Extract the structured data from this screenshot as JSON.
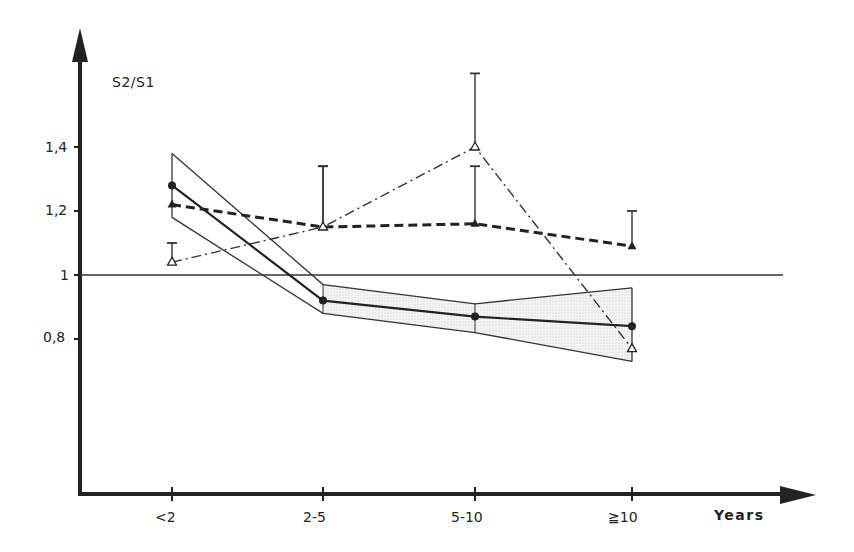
{
  "chart_data": {
    "type": "line",
    "title": "",
    "ylabel": "S2/S1",
    "xlabel": "Years",
    "categories": [
      "<2",
      "2-5",
      "5-10",
      "≧10"
    ],
    "y_ticks": [
      {
        "value": 1.4,
        "label": "1,4"
      },
      {
        "value": 1.2,
        "label": "1,2"
      },
      {
        "value": 1.0,
        "label": "1"
      },
      {
        "value": 0.8,
        "label": "0,8"
      }
    ],
    "ylim": [
      0.34,
      1.75
    ],
    "reference_line": 1.0,
    "grid": false,
    "series": [
      {
        "name": "solid-circle-mean",
        "style": "solid",
        "marker": "filled-circle",
        "values": [
          1.28,
          0.92,
          0.87,
          0.84
        ],
        "band_upper": [
          1.38,
          0.97,
          0.91,
          0.96
        ],
        "band_lower": [
          1.18,
          0.88,
          0.82,
          0.73
        ]
      },
      {
        "name": "bold-dashed-filled-triangle",
        "style": "bold-dashed",
        "marker": "filled-triangle",
        "values": [
          1.22,
          1.15,
          1.16,
          1.09
        ],
        "error_upper": [
          null,
          1.34,
          1.34,
          1.2
        ]
      },
      {
        "name": "dash-dot-open-triangle",
        "style": "dash-dot",
        "marker": "open-triangle",
        "values": [
          1.04,
          1.15,
          1.4,
          0.77
        ],
        "error_upper": [
          1.1,
          1.34,
          1.63,
          null
        ]
      }
    ]
  },
  "labels": {
    "y_axis_title": "S2/S1",
    "x_axis_title": "Years",
    "x_ticks": [
      "<2",
      "2-5",
      "5-10",
      "≧10"
    ],
    "y_ticks": [
      "1,4",
      "1,2",
      "1",
      "0,8"
    ]
  }
}
